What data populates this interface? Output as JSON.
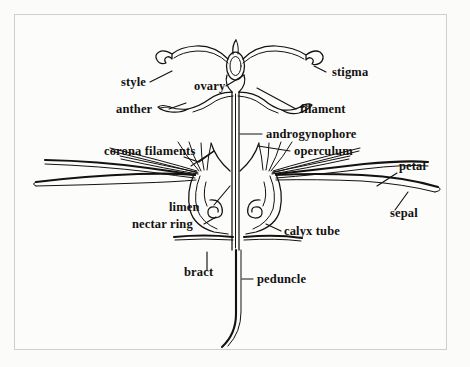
{
  "figure": {
    "background_color": "#fbfbfa",
    "ink_color": "#141210",
    "border_color": "#cfcfcc"
  },
  "labels": {
    "style": "style",
    "ovary": "ovary",
    "stigma": "stigma",
    "anther": "anther",
    "filament": "filament",
    "androgynophore": "androgynophore",
    "corona_filaments": "corona filaments",
    "operculum": "operculum",
    "petal": "petal",
    "sepal": "sepal",
    "limen": "limen",
    "nectar_ring": "nectar ring",
    "calyx_tube": "calyx tube",
    "bract": "bract",
    "peduncle": "peduncle"
  },
  "parts": [
    {
      "name": "stigma",
      "label": "stigma",
      "count": 3,
      "description": "club-shaped knob at tip of each style"
    },
    {
      "name": "style",
      "label": "style",
      "count": 3,
      "description": "arching stalk from ovary to stigma"
    },
    {
      "name": "ovary",
      "label": "ovary",
      "count": 1,
      "description": "central ovoid body at top of androgynophore"
    },
    {
      "name": "anther",
      "label": "anther",
      "count": 2,
      "description": "elongate pollen sac at end of filament"
    },
    {
      "name": "filament",
      "label": "filament",
      "count": 2,
      "description": "stalk bearing the anther"
    },
    {
      "name": "androgynophore",
      "label": "androgynophore",
      "count": 1,
      "description": "narrow vertical column supporting stamens and ovary"
    },
    {
      "name": "operculum",
      "label": "operculum",
      "count": 1,
      "description": "membranous flap inside the corona"
    },
    {
      "name": "corona-filaments",
      "label": "corona filaments",
      "count": 12,
      "description": "radiating thread-like rays of the corona"
    },
    {
      "name": "petal",
      "label": "petal",
      "count": 2,
      "description": "upper long tapering blade"
    },
    {
      "name": "sepal",
      "label": "sepal",
      "count": 2,
      "description": "lower long tapering blade"
    },
    {
      "name": "limen",
      "label": "limen",
      "count": 1,
      "description": "rim inside base of calyx tube"
    },
    {
      "name": "nectar-ring",
      "label": "nectar ring",
      "count": 2,
      "description": "inrolled spiral at base of calyx tube"
    },
    {
      "name": "calyx-tube",
      "label": "calyx tube",
      "count": 1,
      "description": "cup enclosing base of androgynophore"
    },
    {
      "name": "bract",
      "label": "bract",
      "count": 2,
      "description": "horizontal leafy appendage below the calyx"
    },
    {
      "name": "peduncle",
      "label": "peduncle",
      "count": 1,
      "description": "flower stalk descending and curving below"
    }
  ],
  "label_positions": {
    "style": {
      "x": 132,
      "y": 72,
      "anchor": "end"
    },
    "ovary": {
      "x": 180,
      "y": 76,
      "anchor": "start"
    },
    "stigma": {
      "x": 318,
      "y": 62,
      "anchor": "start"
    },
    "anther": {
      "x": 114,
      "y": 99,
      "anchor": "start"
    },
    "filament": {
      "x": 286,
      "y": 99,
      "anchor": "start"
    },
    "androgynophore": {
      "x": 252,
      "y": 124,
      "anchor": "start"
    },
    "corona_filaments": {
      "x": 104,
      "y": 141,
      "anchor": "start"
    },
    "operculum": {
      "x": 280,
      "y": 141,
      "anchor": "start"
    },
    "petal": {
      "x": 385,
      "y": 156,
      "anchor": "start"
    },
    "sepal": {
      "x": 376,
      "y": 203,
      "anchor": "start"
    },
    "limen": {
      "x": 167,
      "y": 197,
      "anchor": "start"
    },
    "nectar_ring": {
      "x": 134,
      "y": 214,
      "anchor": "start"
    },
    "calyx_tube": {
      "x": 270,
      "y": 221,
      "anchor": "start"
    },
    "bract": {
      "x": 185,
      "y": 262,
      "anchor": "start"
    },
    "peduncle": {
      "x": 243,
      "y": 269,
      "anchor": "start"
    }
  }
}
